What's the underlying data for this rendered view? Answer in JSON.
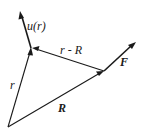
{
  "diagram": {
    "type": "vector-diagram",
    "points": {
      "origin": {
        "x": 8,
        "y": 127
      },
      "r_tip": {
        "x": 31,
        "y": 48
      },
      "R_tip": {
        "x": 104,
        "y": 71
      }
    },
    "vectors": [
      {
        "id": "r",
        "label": "r",
        "from": "origin",
        "to": "r_tip"
      },
      {
        "id": "R",
        "label": "R",
        "from": "origin",
        "to": "R_tip"
      },
      {
        "id": "r_minus_R",
        "label": "r - R",
        "from": "R_tip",
        "to": "r_tip"
      },
      {
        "id": "u_r",
        "label": "u(r)",
        "from": "r_tip",
        "to_xy": {
          "x": 20,
          "y": 12
        }
      },
      {
        "id": "F",
        "label": "F",
        "from": "R_tip",
        "to_xy": {
          "x": 135,
          "y": 43
        }
      }
    ]
  },
  "labels": {
    "u_r": "u(r)",
    "r_minus_R": "r - R",
    "F": "F",
    "r": "r",
    "R": "R"
  }
}
